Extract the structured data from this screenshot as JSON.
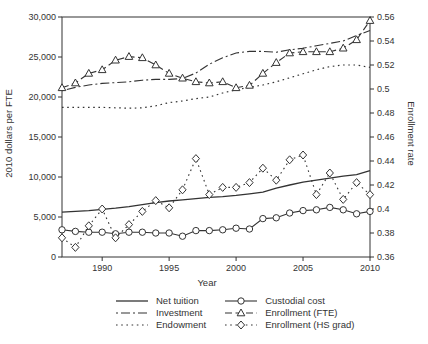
{
  "figure": {
    "xlabel": "Year",
    "ylabel_left": "2010 dollars per FTE",
    "ylabel_right": "Enrollment rate"
  },
  "chart_data": {
    "type": "line",
    "title": "",
    "xlabel": "Year",
    "ylabel_left": "2010 dollars per FTE",
    "ylabel_right": "Enrollment rate",
    "x": [
      1987,
      1988,
      1989,
      1990,
      1991,
      1992,
      1993,
      1994,
      1995,
      1996,
      1997,
      1998,
      1999,
      2000,
      2001,
      2002,
      2003,
      2004,
      2005,
      2006,
      2007,
      2008,
      2009,
      2010
    ],
    "x_range": [
      1987,
      2010
    ],
    "x_tick_values": [
      1990,
      1995,
      2000,
      2005,
      2010
    ],
    "x_tick_labels": [
      "1990",
      "1995",
      "2000",
      "2005",
      "2010"
    ],
    "left_axis": {
      "range": [
        0,
        30000
      ],
      "tick_values": [
        0,
        5000,
        10000,
        15000,
        20000,
        25000,
        30000
      ],
      "tick_labels": [
        "0",
        "5,000",
        "10,000",
        "15,000",
        "20,000",
        "25,000",
        "30,000"
      ]
    },
    "right_axis": {
      "range": [
        0.36,
        0.56
      ],
      "tick_values": [
        0.36,
        0.38,
        0.4,
        0.42,
        0.44,
        0.46,
        0.48,
        0.5,
        0.52,
        0.54,
        0.56
      ],
      "tick_labels": [
        "0.36",
        "0.38",
        "0.4",
        "0.42",
        "0.44",
        "0.46",
        "0.48",
        "0.5",
        "0.52",
        "0.54",
        "0.56"
      ]
    },
    "grid": false,
    "line_color": "#333333",
    "series": [
      {
        "name": "Net tuition",
        "axis": "left",
        "line": "solid",
        "marker": "none",
        "width": 1.3,
        "values": [
          5600,
          5700,
          5800,
          5950,
          6100,
          6300,
          6550,
          6800,
          7000,
          7150,
          7300,
          7450,
          7550,
          7700,
          7900,
          8100,
          8600,
          9000,
          9350,
          9600,
          9850,
          10100,
          10300,
          10800
        ]
      },
      {
        "name": "Investment",
        "axis": "left",
        "line": "dashdot",
        "marker": "none",
        "width": 1.1,
        "values": [
          20800,
          21200,
          21500,
          21700,
          21800,
          21900,
          22100,
          22200,
          22200,
          22300,
          23000,
          24100,
          24900,
          25500,
          25700,
          25700,
          25600,
          25900,
          26100,
          26400,
          26700,
          27000,
          27700,
          28300
        ]
      },
      {
        "name": "Endowment",
        "axis": "left",
        "line": "dotted",
        "marker": "none",
        "width": 1.2,
        "values": [
          18700,
          18700,
          18700,
          18700,
          18650,
          18600,
          18650,
          18900,
          19300,
          19500,
          19800,
          20000,
          20500,
          20900,
          21200,
          21500,
          21900,
          22400,
          22900,
          23400,
          23800,
          24000,
          24000,
          23700
        ]
      },
      {
        "name": "Custodial cost",
        "axis": "left",
        "line": "solid",
        "marker": "circle",
        "width": 1.1,
        "values": [
          3400,
          3200,
          3100,
          3100,
          2900,
          3100,
          3100,
          3000,
          3000,
          2600,
          3300,
          3300,
          3400,
          3600,
          3500,
          4800,
          4900,
          5500,
          5800,
          5900,
          6200,
          5900,
          5400,
          5700
        ]
      },
      {
        "name": "Enrollment (FTE)",
        "axis": "right",
        "line": "dashed",
        "marker": "triangle",
        "width": 1.1,
        "values": [
          0.501,
          0.505,
          0.513,
          0.516,
          0.524,
          0.527,
          0.526,
          0.52,
          0.513,
          0.509,
          0.506,
          0.505,
          0.506,
          0.501,
          0.503,
          0.513,
          0.522,
          0.53,
          0.531,
          0.531,
          0.531,
          0.534,
          0.541,
          0.557
        ]
      },
      {
        "name": "Enrollment (HS grad)",
        "axis": "right",
        "line": "dotted",
        "marker": "diamond",
        "width": 1.1,
        "values": [
          0.376,
          0.368,
          0.386,
          0.4,
          0.376,
          0.387,
          0.398,
          0.407,
          0.401,
          0.416,
          0.442,
          0.412,
          0.418,
          0.418,
          0.422,
          0.434,
          0.424,
          0.441,
          0.445,
          0.412,
          0.43,
          0.408,
          0.422,
          0.412
        ]
      }
    ],
    "legend": {
      "position": "bottom",
      "columns": [
        [
          "Net tuition",
          "Investment",
          "Endowment"
        ],
        [
          "Custodial cost",
          "Enrollment (FTE)",
          "Enrollment (HS grad)"
        ]
      ]
    }
  }
}
